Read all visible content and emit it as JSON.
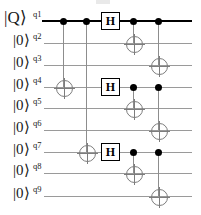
{
  "diagram": {
    "type": "quantum-circuit",
    "width": 201,
    "height": 215
  },
  "colors": {
    "primary_wire": "#000000",
    "wire": "#9a9a9a",
    "control_dot": "#000000",
    "target_ring": "#7d7d7d",
    "gate_border": "#000000",
    "gate_fill": "#ffffff",
    "text": "#1a1a1a"
  },
  "wires": [
    {
      "id": "q1",
      "label": "q1",
      "ket": "|Q⟩",
      "y": 21,
      "primary": true
    },
    {
      "id": "q2",
      "label": "q2",
      "ket": "|0⟩",
      "y": 43,
      "primary": false
    },
    {
      "id": "q3",
      "label": "q3",
      "ket": "|0⟩",
      "y": 65,
      "primary": false
    },
    {
      "id": "q4",
      "label": "q4",
      "ket": "|0⟩",
      "y": 87,
      "primary": false
    },
    {
      "id": "q5",
      "label": "q5",
      "ket": "|0⟩",
      "y": 108,
      "primary": false
    },
    {
      "id": "q6",
      "label": "q6",
      "ket": "|0⟩",
      "y": 130,
      "primary": false
    },
    {
      "id": "q7",
      "label": "q7",
      "ket": "|0⟩",
      "y": 152,
      "primary": false
    },
    {
      "id": "q8",
      "label": "q8",
      "ket": "|0⟩",
      "y": 173,
      "primary": false
    },
    {
      "id": "q9",
      "label": "q9",
      "ket": "|0⟩",
      "y": 196,
      "primary": false
    }
  ],
  "columns": [
    63,
    86,
    110,
    133,
    158
  ],
  "gates": [
    {
      "kind": "cnot",
      "name": "cnot-q1-q4",
      "x": 63,
      "control_y": 21,
      "target_y": 87
    },
    {
      "kind": "cnot",
      "name": "cnot-q1-q7",
      "x": 86,
      "control_y": 21,
      "target_y": 152
    },
    {
      "kind": "h",
      "name": "hadamard-q1",
      "label": "H",
      "x": 110,
      "y": 21
    },
    {
      "kind": "h",
      "name": "hadamard-q4",
      "label": "H",
      "x": 110,
      "y": 87
    },
    {
      "kind": "h",
      "name": "hadamard-q7",
      "label": "H",
      "x": 110,
      "y": 152
    },
    {
      "kind": "cnot",
      "name": "cnot-q1-q2",
      "x": 133,
      "control_y": 21,
      "target_y": 43
    },
    {
      "kind": "cnot",
      "name": "cnot-q1-q3",
      "x": 158,
      "control_y": 21,
      "target_y": 65
    },
    {
      "kind": "cnot",
      "name": "cnot-q4-q5",
      "x": 133,
      "control_y": 87,
      "target_y": 108
    },
    {
      "kind": "cnot",
      "name": "cnot-q4-q6",
      "x": 158,
      "control_y": 87,
      "target_y": 130
    },
    {
      "kind": "cnot",
      "name": "cnot-q7-q8",
      "x": 133,
      "control_y": 152,
      "target_y": 173
    },
    {
      "kind": "cnot",
      "name": "cnot-q7-q9",
      "x": 158,
      "control_y": 152,
      "target_y": 196
    }
  ]
}
